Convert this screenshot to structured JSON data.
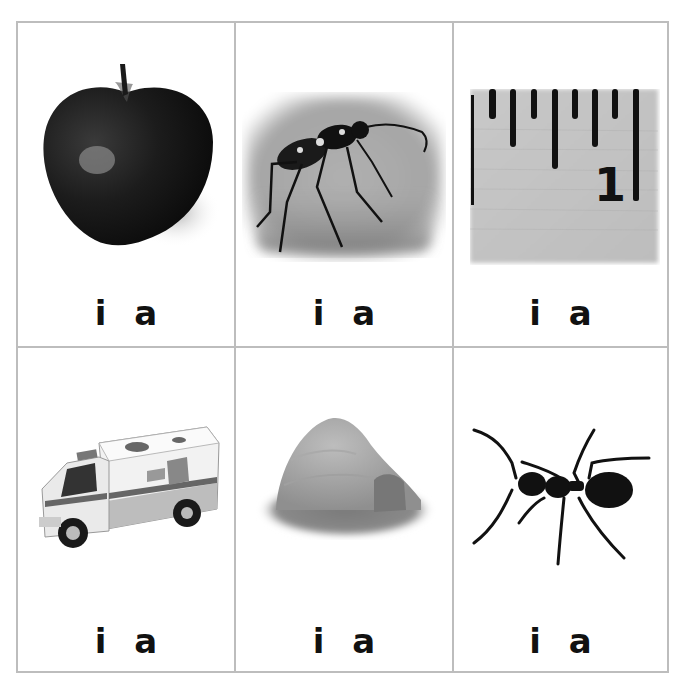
{
  "worksheet": {
    "instructions": "",
    "cells": [
      {
        "picture": "apple",
        "choices": [
          "i",
          "a"
        ]
      },
      {
        "picture": "beetle",
        "choices": [
          "i",
          "a"
        ]
      },
      {
        "picture": "ruler-inch",
        "choices": [
          "i",
          "a"
        ]
      },
      {
        "picture": "ambulance",
        "choices": [
          "i",
          "a"
        ]
      },
      {
        "picture": "igloo",
        "choices": [
          "i",
          "a"
        ]
      },
      {
        "picture": "ant",
        "choices": [
          "i",
          "a"
        ]
      }
    ],
    "ruler_label": "1"
  },
  "colors": {
    "grid_line": "#bdbdbd",
    "text": "#111111",
    "background": "#ffffff"
  }
}
